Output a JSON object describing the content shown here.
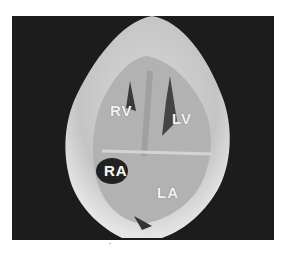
{
  "image": {
    "subject": "heart specimen four-chamber view",
    "background_color": "#1c1c1c",
    "tissue_color": "#cfcfcf"
  },
  "labels": {
    "rv": "RV",
    "lv": "LV",
    "ra": "RA",
    "la": "LA"
  }
}
